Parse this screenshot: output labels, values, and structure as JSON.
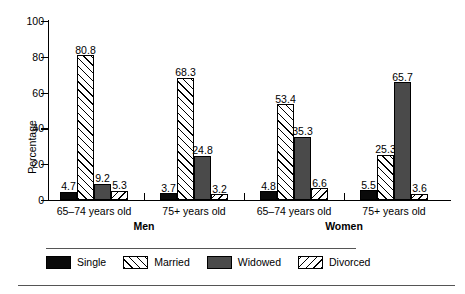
{
  "chart_data": {
    "type": "bar",
    "title": "",
    "xlabel": "",
    "ylabel": "Percentage",
    "ylim": [
      0,
      100
    ],
    "yticks": [
      0,
      20,
      40,
      60,
      80,
      100
    ],
    "grid": false,
    "legend_position": "bottom",
    "groups": [
      {
        "super": "Men",
        "category": "65–74 years old"
      },
      {
        "super": "Men",
        "category": "75+ years old"
      },
      {
        "super": "Women",
        "category": "65–74 years old"
      },
      {
        "super": "Women",
        "category": "75+ years old"
      }
    ],
    "categories": [
      "65–74 years old",
      "75+ years old",
      "65–74 years old",
      "75+ years old"
    ],
    "supergroups": [
      "Men",
      "Women"
    ],
    "series": [
      {
        "name": "Single",
        "pattern": "solid-black",
        "color": "#0a0a0a",
        "values": [
          4.7,
          3.7,
          4.8,
          5.5
        ]
      },
      {
        "name": "Married",
        "pattern": "forward-hatch",
        "color": "#ffffff",
        "values": [
          80.8,
          68.3,
          53.4,
          25.3
        ]
      },
      {
        "name": "Widowed",
        "pattern": "solid-darkgray",
        "color": "#4a4a4a",
        "values": [
          9.2,
          24.8,
          35.3,
          65.7
        ]
      },
      {
        "name": "Divorced",
        "pattern": "backward-hatch",
        "color": "#ffffff",
        "values": [
          5.3,
          3.2,
          6.6,
          3.6
        ]
      }
    ]
  }
}
